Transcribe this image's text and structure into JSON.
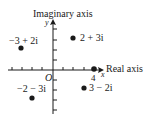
{
  "diagram": {
    "y_axis_label": "Imaginary axis",
    "x_axis_label": "Real axis",
    "y_var": "y",
    "x_var": "x",
    "origin_label": "O",
    "tick_label_4": "4",
    "points": [
      {
        "label": "2 + 3i",
        "re": 2,
        "im": 3
      },
      {
        "label": "−3 + 2i",
        "re": -3,
        "im": 2
      },
      {
        "label": "−2 − 3i",
        "re": -2,
        "im": -3
      },
      {
        "label": "3 − 2i",
        "re": 3,
        "im": -2
      },
      {
        "label": "4",
        "re": 4,
        "im": 0
      }
    ],
    "colors": {
      "ink": "#1a1a1a",
      "background": "#ffffff"
    }
  }
}
